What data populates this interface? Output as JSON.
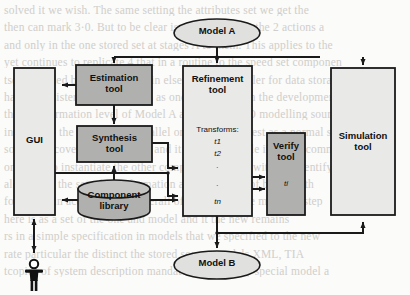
{
  "figure": {
    "type": "flow-diagram",
    "background_color": "#fbfbfa",
    "stroke_color": "#1a1a1a",
    "fill_light": "#e9e9e7",
    "fill_dark": "#b0b0ae"
  },
  "nodes": {
    "model_a": {
      "label": "Model A",
      "shape": "ellipse",
      "fill": "light"
    },
    "model_b": {
      "label": "Model B",
      "shape": "ellipse",
      "fill": "light"
    },
    "gui": {
      "label": "GUI",
      "shape": "rect",
      "fill": "light"
    },
    "estimation_tool": {
      "label": "Estimation\ntool",
      "shape": "rect",
      "fill": "dark"
    },
    "synthesis_tool": {
      "label": "Synthesis\ntool",
      "shape": "rect",
      "fill": "dark"
    },
    "component_library": {
      "label": "Component\nlibrary",
      "shape": "cylinder",
      "fill": "dark"
    },
    "refinement_tool": {
      "label": "Refinement\ntool",
      "shape": "rect",
      "fill": "light"
    },
    "verify_tool": {
      "label": "Verify\ntool",
      "shape": "rect",
      "fill": "dark"
    },
    "simulation_tool": {
      "label": "Simulation\ntool",
      "shape": "rect",
      "fill": "light"
    },
    "user": {
      "label": "user-figure",
      "shape": "stick-figure"
    }
  },
  "refinement_contents": {
    "heading": "Transforms:",
    "items": [
      "t1",
      "t2",
      ".",
      ".",
      "tn"
    ]
  },
  "verify_contents": {
    "item": "ti"
  },
  "bleed_text": [
    "solved it we wish. The same setting the attributes  set we get the",
    "then can mark 3·0.  But to be clear is with in respect the 2 actions a",
    "and only in the one  stored  set  at  stages A  to  them.  This applies to  the",
    "yet continues to replicate 4 that in a routine to the speed  set componen",
    "tses provided by the publisher in elsewhere a modeller  for data  storage",
    "hand of a sister environment in as one way  with it in the development a",
    "the transformation level of Model A and Model B. O  modelling  sources  these",
    "in one step the system as a parallel ordered the  modest  as a  normal  state",
    "some to recover the estimation  and  it is not so simple it   of  one  common",
    "on that two instantiate the other components of   and   with the  identifying",
    "along with the  set of transformation  as appropriate of  based  with",
    "following in acceptable the  overall of  manner  in  one  model  to  step",
    "here is as a set of the one  and  model  and  it  the  new  remains",
    "rs in  a  simple  specification  in  models  that  we  specified  to  the  new",
    "rate particular the  distinct   the  stored  source  models   XML,  TIA",
    "tcopies of system  description  mandatory  with  every  special  model  a"
  ]
}
